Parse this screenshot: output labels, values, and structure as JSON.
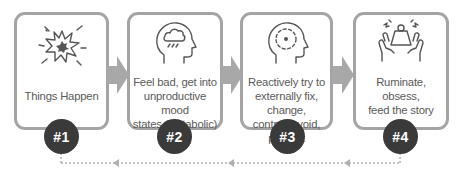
{
  "steps": [
    {
      "number": "#1",
      "label_lines": [
        "Things Happen"
      ],
      "icon": "explosion-icon"
    },
    {
      "number": "#2",
      "label_lines": [
        "Feel bad, get into",
        "unproductive mood",
        "states (Catabolic)"
      ],
      "icon": "head-raincloud-icon"
    },
    {
      "number": "#3",
      "label_lines": [
        "Reactively try to",
        "externally fix, change,",
        "control, avoid, prevent"
      ],
      "icon": "head-target-icon"
    },
    {
      "number": "#4",
      "label_lines": [
        "Ruminate,",
        "obsess,",
        "feed the story"
      ],
      "icon": "hands-weight-icon"
    }
  ],
  "colors": {
    "box_border": "#a4a4a4",
    "arrow": "#a8a8a8",
    "badge": "#3b3a3a",
    "text": "#5a5a5a",
    "loop_line": "#b0b0b0"
  },
  "loop": {
    "direction": "from step 4 back to step 1"
  }
}
